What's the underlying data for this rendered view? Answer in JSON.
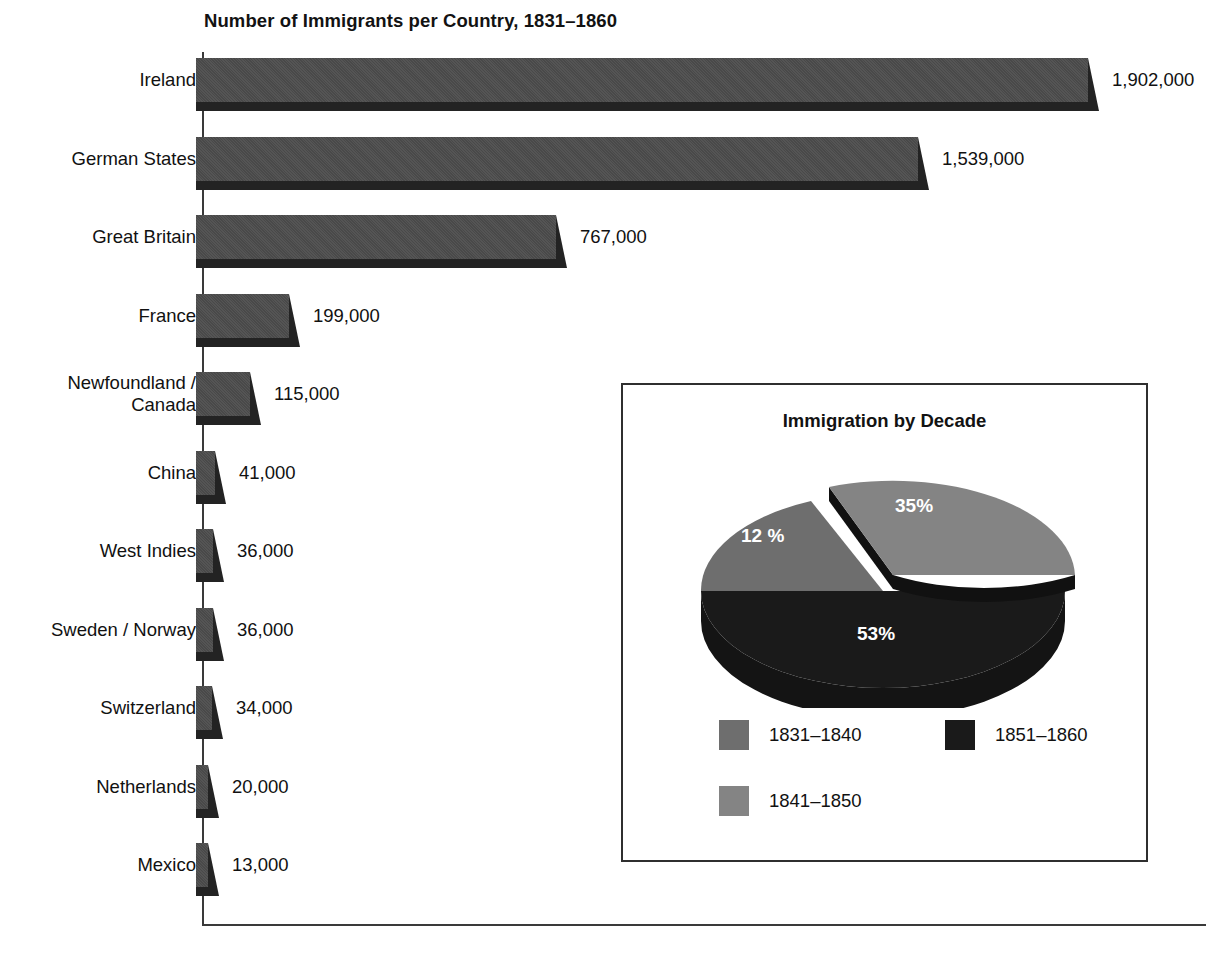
{
  "chart_data": [
    {
      "type": "bar",
      "orientation": "horizontal",
      "title": "Number of Immigrants per Country, 1831–1860",
      "xlabel": "",
      "ylabel": "",
      "grid": false,
      "xlim": [
        0,
        1902000
      ],
      "value_format": "comma-separated integers",
      "categories": [
        "Ireland",
        "German States",
        "Great Britain",
        "France",
        "Newfoundland /\nCanada",
        "China",
        "West Indies",
        "Sweden / Norway",
        "Switzerland",
        "Netherlands",
        "Mexico"
      ],
      "values": [
        1902000,
        1539000,
        767000,
        199000,
        115000,
        41000,
        36000,
        36000,
        34000,
        20000,
        13000
      ],
      "value_labels": [
        "1,902,000",
        "1,539,000",
        "767,000",
        "199,000",
        "115,000",
        "41,000",
        "36,000",
        "36,000",
        "34,000",
        "20,000",
        "13,000"
      ],
      "bar_color": "#4d4d4d",
      "bar_shadow_color": "#232323"
    },
    {
      "type": "pie",
      "title": "Immigration by Decade",
      "exploded_slice": "1841–1850",
      "legend_position": "bottom",
      "labels": [
        "1831–1840",
        "1841–1850",
        "1851–1860"
      ],
      "values": [
        12,
        35,
        53
      ],
      "value_labels": [
        "12 %",
        "35%",
        "53%"
      ],
      "colors": [
        "#6e6e6e",
        "#848484",
        "#1a1a1a"
      ]
    }
  ],
  "bar_chart": {
    "title": "Number of Immigrants per Country, 1831–1860",
    "rows": [
      {
        "label": "Ireland",
        "value_label": "1,902,000"
      },
      {
        "label": "German States",
        "value_label": "1,539,000"
      },
      {
        "label": "Great Britain",
        "value_label": "767,000"
      },
      {
        "label": "France",
        "value_label": "199,000"
      },
      {
        "label": "Newfoundland /\nCanada",
        "value_label": "115,000"
      },
      {
        "label": "China",
        "value_label": "41,000"
      },
      {
        "label": "West Indies",
        "value_label": "36,000"
      },
      {
        "label": "Sweden / Norway",
        "value_label": "36,000"
      },
      {
        "label": "Switzerland",
        "value_label": "34,000"
      },
      {
        "label": "Netherlands",
        "value_label": "20,000"
      },
      {
        "label": "Mexico",
        "value_label": "13,000"
      }
    ]
  },
  "pie_chart": {
    "title": "Immigration by Decade",
    "slices": [
      {
        "pct_label": "35%",
        "legend_label": "1841–1850",
        "color": "#848484"
      },
      {
        "pct_label": "12 %",
        "legend_label": "1831–1840",
        "color": "#6e6e6e"
      },
      {
        "pct_label": "53%",
        "legend_label": "1851–1860",
        "color": "#1a1a1a"
      }
    ],
    "legend": [
      {
        "label": "1831–1840",
        "color": "#6e6e6e"
      },
      {
        "label": "1851–1860",
        "color": "#1a1a1a"
      },
      {
        "label": "1841–1850",
        "color": "#848484"
      }
    ]
  }
}
